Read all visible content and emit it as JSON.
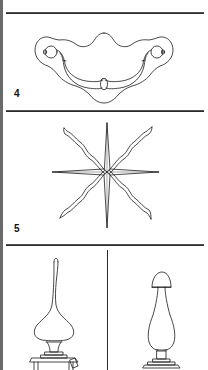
{
  "figure": {
    "panels": [
      {
        "label": "4",
        "subject": "bail-handle-drawer-pull"
      },
      {
        "label": "5",
        "subject": "eight-point-star-with-wavy-rays"
      },
      {
        "label": "",
        "subject": "finial-tall-onion"
      },
      {
        "label": "",
        "subject": "finial-acorn-urn"
      }
    ]
  },
  "colors": {
    "ink": "#1a1a1a",
    "background": "#ffffff",
    "edge": "#6a6a6a"
  }
}
